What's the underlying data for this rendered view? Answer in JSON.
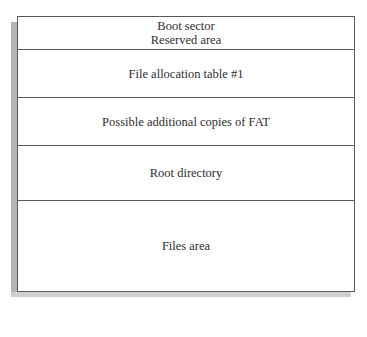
{
  "diagram": {
    "segments": [
      {
        "lines": [
          "Boot sector",
          "Reserved area"
        ],
        "top": 0,
        "height": 32
      },
      {
        "lines": [
          "File allocation table #1"
        ],
        "top": 32,
        "height": 48
      },
      {
        "lines": [
          "Possible additional copies of FAT"
        ],
        "top": 80,
        "height": 48
      },
      {
        "lines": [
          "Root directory"
        ],
        "top": 128,
        "height": 55
      },
      {
        "lines": [
          "Files area"
        ],
        "top": 183,
        "height": 91
      }
    ],
    "colors": {
      "border": "#5a5a5a",
      "text": "#2e2e2e",
      "shadow": "#b4b4b4"
    }
  }
}
